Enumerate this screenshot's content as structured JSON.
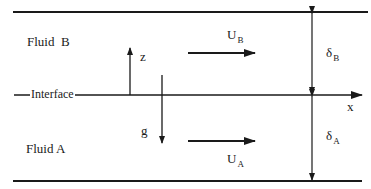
{
  "diagram": {
    "type": "two-layer fluid flow schematic",
    "colors": {
      "line": "#1a1a1a",
      "background": "#ffffff"
    },
    "labels": {
      "fluid_b": "Fluid  B",
      "fluid_a": "Fluid A",
      "interface": "Interface",
      "z_axis": "z",
      "x_axis": "x",
      "gravity": "g",
      "velocity_b": {
        "main": "U",
        "sub": "B"
      },
      "velocity_a": {
        "main": "U",
        "sub": "A"
      },
      "thickness_b": {
        "main": "δ",
        "sub": "B"
      },
      "thickness_a": {
        "main": "δ",
        "sub": "A"
      }
    },
    "elements": [
      "top-wall-line",
      "interface-line-with-x-axis-arrow",
      "bottom-wall-line",
      "z-axis-arrow-up",
      "gravity-arrow-down",
      "velocity-arrow-fluid-b",
      "velocity-arrow-fluid-a",
      "thickness-arrow-fluid-b",
      "thickness-arrow-fluid-a"
    ]
  }
}
